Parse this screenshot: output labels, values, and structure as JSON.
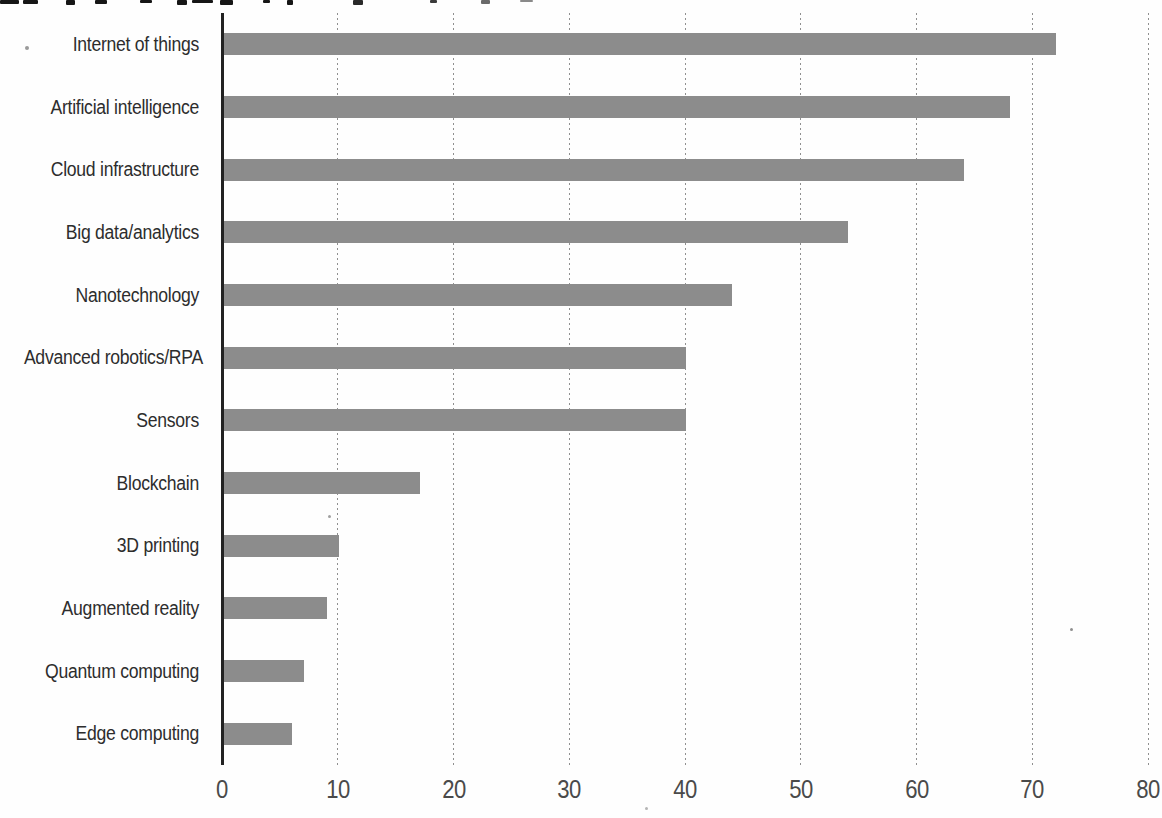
{
  "chart_data": {
    "type": "bar",
    "orientation": "horizontal",
    "title_cropped": true,
    "categories": [
      "Internet of things",
      "Artificial intelligence",
      "Cloud infrastructure",
      "Big data/analytics",
      "Nanotechnology",
      "Advanced robotics/RPA",
      "Sensors",
      "Blockchain",
      "3D printing",
      "Augmented reality",
      "Quantum computing",
      "Edge computing"
    ],
    "values": [
      72,
      68,
      64,
      54,
      44,
      40,
      40,
      17,
      10,
      9,
      7,
      6
    ],
    "xlabel": "",
    "ylabel": "",
    "xlim": [
      0,
      80
    ],
    "xticks": [
      "0",
      "10",
      "20",
      "30",
      "40",
      "50",
      "60",
      "70",
      "80"
    ],
    "grid": "vertical-dashed",
    "legend": "none",
    "bar_color": "#8c8c8c",
    "axis_line_color": "#222222",
    "gridline_color": "#8f8f8f",
    "category_label_color": "#2d2d2d",
    "tick_label_color": "#4a4a4a"
  },
  "cropped_title_marks": [
    {
      "x": 0,
      "w": 19,
      "h": 4,
      "c": "#161616"
    },
    {
      "x": 23,
      "w": 15,
      "h": 4,
      "c": "#161616"
    },
    {
      "x": 66,
      "w": 9,
      "h": 5,
      "c": "#161616"
    },
    {
      "x": 95,
      "w": 12,
      "h": 4,
      "c": "#161616"
    },
    {
      "x": 140,
      "w": 12,
      "h": 3,
      "c": "#161616"
    },
    {
      "x": 177,
      "w": 10,
      "h": 5,
      "c": "#161616"
    },
    {
      "x": 192,
      "w": 21,
      "h": 3,
      "c": "#161616"
    },
    {
      "x": 220,
      "w": 13,
      "h": 5,
      "c": "#161616"
    },
    {
      "x": 263,
      "w": 7,
      "h": 3,
      "c": "#161616"
    },
    {
      "x": 287,
      "w": 6,
      "h": 5,
      "c": "#161616"
    },
    {
      "x": 353,
      "w": 10,
      "h": 5,
      "c": "#2a2a2a"
    },
    {
      "x": 430,
      "w": 7,
      "h": 3,
      "c": "#3a3a3a"
    },
    {
      "x": 481,
      "w": 9,
      "h": 4,
      "c": "#6a6a6a"
    },
    {
      "x": 520,
      "w": 13,
      "h": 2,
      "c": "#8a8a8a"
    }
  ],
  "scan_specks": [
    {
      "x": 25,
      "y": 46,
      "d": 4,
      "c": "#9a9a9a"
    },
    {
      "x": 328,
      "y": 515,
      "d": 3,
      "c": "#a0a0a0"
    },
    {
      "x": 1070,
      "y": 628,
      "d": 3,
      "c": "#8f8f8f"
    },
    {
      "x": 645,
      "y": 807,
      "d": 3,
      "c": "#b5b5b5"
    }
  ]
}
